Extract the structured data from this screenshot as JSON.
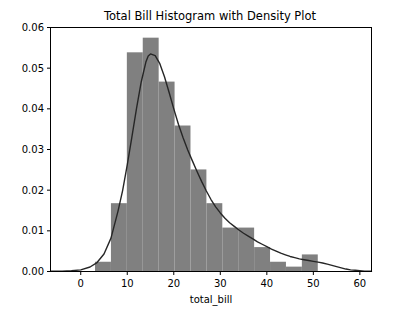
{
  "figure": {
    "width": 395,
    "height": 322,
    "background": "#ffffff"
  },
  "chart_data": {
    "type": "bar",
    "title": "Total Bill Histogram with Density Plot",
    "xlabel": "total_bill",
    "ylabel": "",
    "xlim": [
      -6.5,
      62.5
    ],
    "ylim": [
      0.0,
      0.06
    ],
    "grid": false,
    "legend": null,
    "xticks": [
      0,
      10,
      20,
      30,
      40,
      50,
      60
    ],
    "xtick_labels": [
      "0",
      "10",
      "20",
      "30",
      "40",
      "50",
      "60"
    ],
    "yticks": [
      0.0,
      0.01,
      0.02,
      0.03,
      0.04,
      0.05,
      0.06
    ],
    "ytick_labels": [
      "0.00",
      "0.01",
      "0.02",
      "0.03",
      "0.04",
      "0.05",
      "0.06"
    ],
    "bar_color": "#808080",
    "line_color": "#262626",
    "histogram": {
      "bin_edges": [
        3.07,
        6.49,
        9.91,
        13.33,
        16.75,
        20.17,
        23.59,
        27.01,
        30.43,
        33.85,
        37.27,
        40.69,
        44.11,
        47.53,
        50.95
      ],
      "bin_width": 3.42,
      "densities": [
        0.0024,
        0.0168,
        0.0539,
        0.0575,
        0.0467,
        0.0359,
        0.0251,
        0.0168,
        0.0108,
        0.0108,
        0.006,
        0.0024,
        0.0012,
        0.0042
      ],
      "series_name": "total_bill histogram"
    },
    "density": {
      "series_name": "kde",
      "x": [
        -6.5,
        -4.0,
        -2.0,
        0.0,
        2.0,
        3.5,
        5.0,
        6.5,
        8.0,
        9.0,
        10.0,
        11.0,
        12.0,
        13.0,
        14.0,
        14.5,
        15.0,
        16.0,
        17.0,
        18.0,
        19.0,
        20.0,
        21.0,
        22.0,
        23.0,
        24.0,
        25.0,
        26.0,
        27.0,
        28.0,
        29.0,
        30.0,
        31.0,
        32.0,
        33.0,
        34.0,
        35.0,
        36.0,
        37.0,
        38.0,
        39.0,
        40.0,
        41.0,
        42.0,
        43.0,
        44.0,
        45.0,
        46.0,
        47.0,
        48.0,
        49.0,
        50.0,
        51.0,
        52.0,
        53.0,
        54.0,
        55.0,
        56.0,
        57.0,
        58.0,
        59.0,
        60.0,
        61.0,
        62.5
      ],
      "y": [
        5e-05,
        0.0001,
        0.0002,
        0.0004,
        0.0011,
        0.0022,
        0.0043,
        0.0082,
        0.0148,
        0.0199,
        0.0262,
        0.0331,
        0.0402,
        0.0466,
        0.0515,
        0.053,
        0.0535,
        0.0531,
        0.0511,
        0.0479,
        0.044,
        0.04,
        0.0362,
        0.0329,
        0.0299,
        0.0272,
        0.0246,
        0.0221,
        0.0198,
        0.0177,
        0.0159,
        0.0144,
        0.0131,
        0.012,
        0.0111,
        0.0102,
        0.0094,
        0.0087,
        0.008,
        0.0073,
        0.0067,
        0.0061,
        0.0055,
        0.005,
        0.0045,
        0.0041,
        0.0037,
        0.0034,
        0.0031,
        0.0029,
        0.0027,
        0.0025,
        0.0023,
        0.0021,
        0.0018,
        0.0015,
        0.0012,
        0.0009,
        0.0006,
        0.0004,
        0.0003,
        0.0002,
        0.0001,
        5e-05
      ]
    }
  }
}
